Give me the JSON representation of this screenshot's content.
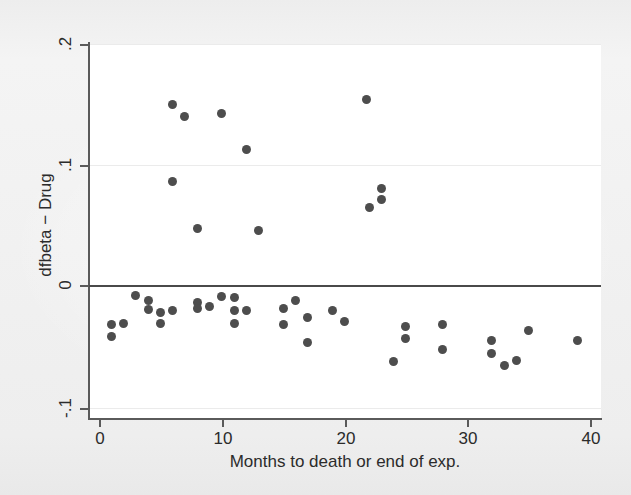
{
  "figure": {
    "background_color": "#f1f1f1",
    "plot_background_color": "#ffffff",
    "marker_color": "#4d4d4d",
    "axis_color": "#5a5a5a",
    "zero_line_color": "#4a4a4a",
    "gridline_color": "#ebebeb"
  },
  "chart_data": {
    "type": "scatter",
    "title": "",
    "xlabel": "Months to death or end of exp.",
    "ylabel": "dfbeta − Drug",
    "xlim": [
      -0.8,
      41.2
    ],
    "ylim": [
      -0.105,
      0.2
    ],
    "xticks": [
      0,
      10,
      20,
      30,
      40
    ],
    "xtick_labels": [
      "0",
      "10",
      "20",
      "30",
      "40"
    ],
    "yticks": [
      0.2,
      0.1,
      0,
      -0.1
    ],
    "ytick_labels": [
      ".2",
      ".1",
      "0",
      "-.1"
    ],
    "grid": "horizontal-faint",
    "legend": null,
    "reference_lines": [
      {
        "orientation": "horizontal",
        "value": 0,
        "style": "solid",
        "color": "#4a4a4a"
      }
    ],
    "series": [
      {
        "name": "dfbeta Drug",
        "marker": "filled-circle",
        "color": "#4d4d4d",
        "points": [
          {
            "x": 1.0,
            "y": -0.031
          },
          {
            "x": 1.0,
            "y": -0.041
          },
          {
            "x": 2.0,
            "y": -0.03
          },
          {
            "x": 3.0,
            "y": -0.007
          },
          {
            "x": 4.0,
            "y": -0.011
          },
          {
            "x": 4.0,
            "y": -0.019
          },
          {
            "x": 5.0,
            "y": -0.021
          },
          {
            "x": 5.0,
            "y": -0.03
          },
          {
            "x": 6.0,
            "y": -0.02
          },
          {
            "x": 6.0,
            "y": 0.15
          },
          {
            "x": 6.0,
            "y": 0.087
          },
          {
            "x": 7.0,
            "y": 0.14
          },
          {
            "x": 8.0,
            "y": -0.013
          },
          {
            "x": 8.0,
            "y": -0.018
          },
          {
            "x": 8.0,
            "y": 0.048
          },
          {
            "x": 9.0,
            "y": -0.016
          },
          {
            "x": 10.0,
            "y": -0.008
          },
          {
            "x": 10.0,
            "y": 0.143
          },
          {
            "x": 11.0,
            "y": -0.009
          },
          {
            "x": 11.0,
            "y": -0.02
          },
          {
            "x": 11.0,
            "y": -0.03
          },
          {
            "x": 12.0,
            "y": -0.02
          },
          {
            "x": 12.0,
            "y": 0.113
          },
          {
            "x": 13.0,
            "y": 0.046
          },
          {
            "x": 15.0,
            "y": -0.018
          },
          {
            "x": 15.0,
            "y": -0.031
          },
          {
            "x": 16.0,
            "y": -0.011
          },
          {
            "x": 17.0,
            "y": -0.025
          },
          {
            "x": 17.0,
            "y": -0.046
          },
          {
            "x": 19.0,
            "y": -0.02
          },
          {
            "x": 20.0,
            "y": -0.029
          },
          {
            "x": 21.8,
            "y": 0.154
          },
          {
            "x": 22.0,
            "y": 0.065
          },
          {
            "x": 23.0,
            "y": 0.081
          },
          {
            "x": 23.0,
            "y": 0.072
          },
          {
            "x": 24.0,
            "y": -0.062
          },
          {
            "x": 25.0,
            "y": -0.033
          },
          {
            "x": 25.0,
            "y": -0.043
          },
          {
            "x": 28.0,
            "y": -0.031
          },
          {
            "x": 28.0,
            "y": -0.052
          },
          {
            "x": 32.0,
            "y": -0.044
          },
          {
            "x": 32.0,
            "y": -0.055
          },
          {
            "x": 33.0,
            "y": -0.065
          },
          {
            "x": 34.0,
            "y": -0.061
          },
          {
            "x": 35.0,
            "y": -0.036
          },
          {
            "x": 39.0,
            "y": -0.044
          }
        ]
      }
    ]
  }
}
